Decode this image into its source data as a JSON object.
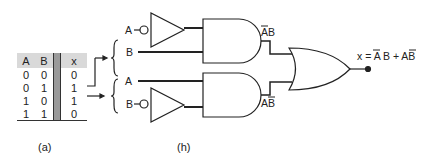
{
  "truth_table": {
    "headers": [
      "A",
      "B",
      "x"
    ],
    "rows": [
      [
        "0",
        "0",
        "0"
      ],
      [
        "0",
        "1",
        "1"
      ],
      [
        "1",
        "0",
        "1"
      ],
      [
        "1",
        "1",
        "0"
      ]
    ]
  },
  "captions": {
    "left": "(a)",
    "right": "(h)"
  },
  "circuit": {
    "top_inputs": {
      "a": "A",
      "b": "B"
    },
    "bottom_inputs": {
      "a": "A",
      "b": "B"
    },
    "top_and_output": "AB",
    "bottom_and_output": "AB",
    "output_expression_prefix": "x = ",
    "output_expression": "x = A B + AB"
  }
}
